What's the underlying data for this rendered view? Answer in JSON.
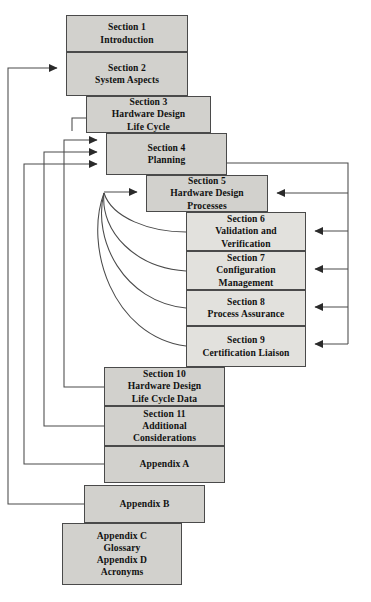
{
  "diagram": {
    "colors": {
      "box_fill": "#d2d1cd",
      "box_border": "#4a4a4a",
      "wire": "#4a4a4a",
      "page_background": "#ffffff",
      "text": "#111111"
    },
    "boxes": [
      {
        "id": "section-1",
        "lines": [
          "Section 1",
          "Introduction"
        ]
      },
      {
        "id": "section-2",
        "lines": [
          "Section 2",
          "System Aspects"
        ]
      },
      {
        "id": "section-3",
        "lines": [
          "Section 3",
          "Hardware Design",
          "Life Cycle"
        ]
      },
      {
        "id": "section-4",
        "lines": [
          "Section 4",
          "Planning"
        ]
      },
      {
        "id": "section-5",
        "lines": [
          "Section 5",
          "Hardware Design",
          "Processes"
        ]
      },
      {
        "id": "section-6",
        "lines": [
          "Section 6",
          "Validation and",
          "Verification"
        ]
      },
      {
        "id": "section-7",
        "lines": [
          "Section 7",
          "Configuration",
          "Management"
        ]
      },
      {
        "id": "section-8",
        "lines": [
          "Section 8",
          "Process Assurance"
        ]
      },
      {
        "id": "section-9",
        "lines": [
          "Section 9",
          "Certification Liaison"
        ]
      },
      {
        "id": "section-10",
        "lines": [
          "Section 10",
          "Hardware Design",
          "Life Cycle Data"
        ]
      },
      {
        "id": "section-11",
        "lines": [
          "Section 11",
          "Additional",
          "Considerations"
        ]
      },
      {
        "id": "appendix-a",
        "lines": [
          "Appendix A"
        ]
      },
      {
        "id": "appendix-b",
        "lines": [
          "Appendix B"
        ]
      },
      {
        "id": "appendix-cd",
        "lines": [
          "Appendix C",
          "Glossary",
          "Appendix D",
          "Acronyms"
        ]
      }
    ]
  }
}
